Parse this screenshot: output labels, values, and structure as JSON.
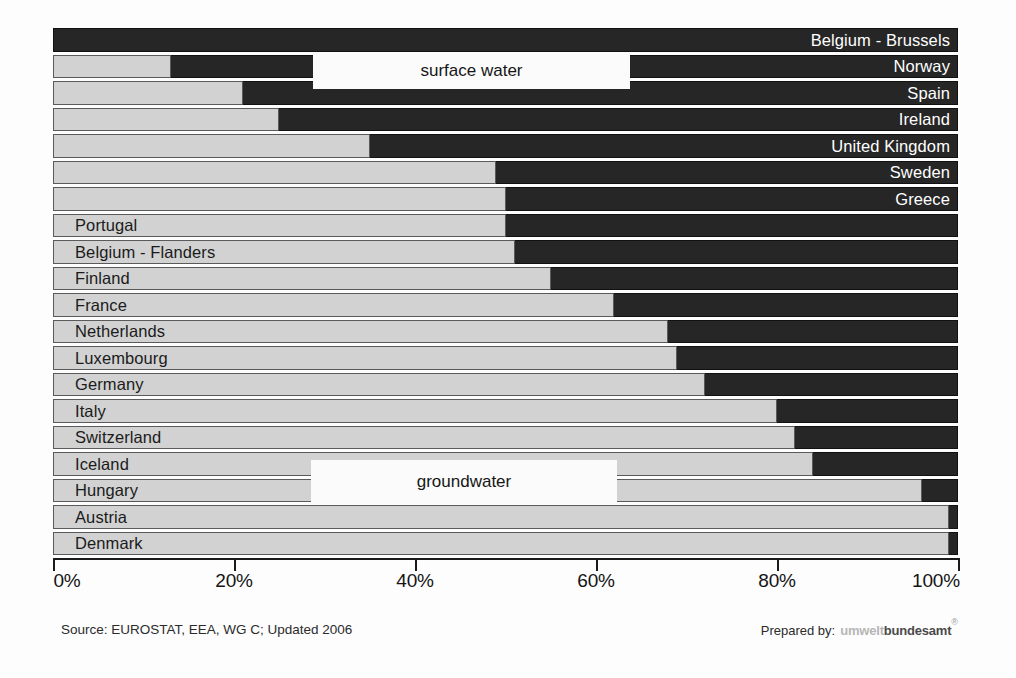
{
  "chart_data": {
    "type": "bar",
    "orientation": "horizontal",
    "stacked": true,
    "title": "",
    "xlabel": "",
    "ylabel": "",
    "xlim": [
      0,
      100
    ],
    "xticks": [
      "0%",
      "20%",
      "40%",
      "60%",
      "80%",
      "100%"
    ],
    "xtick_values": [
      0,
      20,
      40,
      60,
      80,
      100
    ],
    "grid": false,
    "legend_position": "inside",
    "series": [
      {
        "name": "groundwater",
        "color": "#d2d2d2"
      },
      {
        "name": "surface water",
        "color": "#262626"
      }
    ],
    "categories": [
      "Belgium - Brussels",
      "Norway",
      "Spain",
      "Ireland",
      "United Kingdom",
      "Sweden",
      "Greece",
      "Portugal",
      "Belgium - Flanders",
      "Finland",
      "France",
      "Netherlands",
      "Luxembourg",
      "Germany",
      "Italy",
      "Switzerland",
      "Iceland",
      "Hungary",
      "Austria",
      "Denmark"
    ],
    "rows": [
      {
        "label": "Belgium - Brussels",
        "groundwater": 0,
        "surface_water": 100,
        "label_on": "dark"
      },
      {
        "label": "Norway",
        "groundwater": 13,
        "surface_water": 87,
        "label_on": "dark"
      },
      {
        "label": "Spain",
        "groundwater": 21,
        "surface_water": 79,
        "label_on": "dark"
      },
      {
        "label": "Ireland",
        "groundwater": 25,
        "surface_water": 75,
        "label_on": "dark"
      },
      {
        "label": "United Kingdom",
        "groundwater": 35,
        "surface_water": 65,
        "label_on": "dark"
      },
      {
        "label": "Sweden",
        "groundwater": 49,
        "surface_water": 51,
        "label_on": "dark"
      },
      {
        "label": "Greece",
        "groundwater": 50,
        "surface_water": 50,
        "label_on": "dark"
      },
      {
        "label": "Portugal",
        "groundwater": 50,
        "surface_water": 50,
        "label_on": "light"
      },
      {
        "label": "Belgium - Flanders",
        "groundwater": 51,
        "surface_water": 49,
        "label_on": "light"
      },
      {
        "label": "Finland",
        "groundwater": 55,
        "surface_water": 45,
        "label_on": "light"
      },
      {
        "label": "France",
        "groundwater": 62,
        "surface_water": 38,
        "label_on": "light"
      },
      {
        "label": "Netherlands",
        "groundwater": 68,
        "surface_water": 32,
        "label_on": "light"
      },
      {
        "label": "Luxembourg",
        "groundwater": 69,
        "surface_water": 31,
        "label_on": "light"
      },
      {
        "label": "Germany",
        "groundwater": 72,
        "surface_water": 28,
        "label_on": "light"
      },
      {
        "label": "Italy",
        "groundwater": 80,
        "surface_water": 20,
        "label_on": "light"
      },
      {
        "label": "Switzerland",
        "groundwater": 82,
        "surface_water": 18,
        "label_on": "light"
      },
      {
        "label": "Iceland",
        "groundwater": 84,
        "surface_water": 16,
        "label_on": "light"
      },
      {
        "label": "Hungary",
        "groundwater": 96,
        "surface_water": 4,
        "label_on": "light"
      },
      {
        "label": "Austria",
        "groundwater": 99,
        "surface_water": 1,
        "label_on": "light"
      },
      {
        "label": "Denmark",
        "groundwater": 99,
        "surface_water": 1,
        "label_on": "light"
      }
    ]
  },
  "legend": {
    "surface_water": "surface water",
    "groundwater": "groundwater"
  },
  "footer": {
    "source": "Source: EUROSTAT, EEA, WG C; Updated 2006",
    "prepared_by_label": "Prepared by:",
    "brand_light": "umwelt",
    "brand_dark": "bundesamt",
    "registered_mark": "®"
  }
}
